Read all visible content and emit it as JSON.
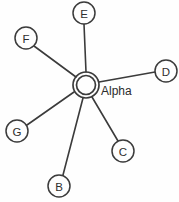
{
  "diagram": {
    "type": "star-topology-graph",
    "width": 179,
    "height": 202,
    "background_color": "#fefefe",
    "stroke_color": "#3b3b3b",
    "hub": {
      "label": "Alpha",
      "cx": 86,
      "cy": 85,
      "outer_radius": 13,
      "inner_radius": 9.5,
      "label_x": 101,
      "label_y": 91
    },
    "nodes": [
      {
        "label": "E",
        "cx": 84,
        "cy": 13,
        "r": 11
      },
      {
        "label": "F",
        "cx": 26,
        "cy": 38,
        "r": 11
      },
      {
        "label": "D",
        "cx": 166,
        "cy": 71,
        "r": 11
      },
      {
        "label": "C",
        "cx": 123,
        "cy": 151,
        "r": 11
      },
      {
        "label": "B",
        "cx": 59,
        "cy": 186,
        "r": 11
      },
      {
        "label": "G",
        "cx": 17,
        "cy": 131,
        "r": 11
      }
    ],
    "edges": [
      {
        "from": "Alpha",
        "to": "E",
        "x1": 86,
        "y1": 72,
        "x2": 84,
        "y2": 24
      },
      {
        "from": "Alpha",
        "to": "F",
        "x1": 76,
        "y1": 77,
        "x2": 34,
        "y2": 46
      },
      {
        "from": "Alpha",
        "to": "D",
        "x1": 99,
        "y1": 82,
        "x2": 155,
        "y2": 72
      },
      {
        "from": "Alpha",
        "to": "C",
        "x1": 92,
        "y1": 97,
        "x2": 118,
        "y2": 141
      },
      {
        "from": "Alpha",
        "to": "B",
        "x1": 83,
        "y1": 98,
        "x2": 63,
        "y2": 175
      },
      {
        "from": "Alpha",
        "to": "G",
        "x1": 74,
        "y1": 92,
        "x2": 27,
        "y2": 125
      }
    ]
  }
}
